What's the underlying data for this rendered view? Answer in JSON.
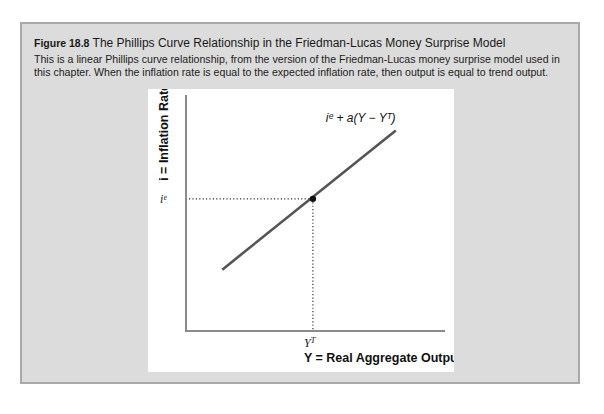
{
  "figure": {
    "number": "Figure 18.8",
    "title": "The Phillips Curve Relationship in the Friedman-Lucas Money Surprise Model",
    "description": "This is a linear Phillips curve relationship, from the version of the Friedman-Lucas money surprise model used in this chapter. When the inflation rate is equal to the expected inflation rate, then output is equal to trend output."
  },
  "chart_data": {
    "type": "line",
    "title": "The Phillips Curve Relationship in the Friedman-Lucas Money Surprise Model",
    "xlabel": "Y = Real Aggregate Output",
    "ylabel": "i = Inflation Rate",
    "x_tick_labels": [
      "Y^T"
    ],
    "y_tick_labels": [
      "i^e"
    ],
    "xlim": [
      0,
      10
    ],
    "ylim": [
      0,
      10
    ],
    "grid": false,
    "series": [
      {
        "name": "i^e + a(Y − Y^T)",
        "label": "iᵉ + a(Y − Yᵀ)",
        "x": [
          1.4,
          8.1
        ],
        "y": [
          2.6,
          8.5
        ],
        "color": "#555555"
      }
    ],
    "annotations": [
      {
        "type": "point",
        "x": 4.9,
        "y": 5.6,
        "label": "equilibrium (Y^T, i^e)"
      },
      {
        "type": "dotted-guide-horizontal",
        "y": 5.6,
        "label": "iᵉ"
      },
      {
        "type": "dotted-guide-vertical",
        "x": 4.9,
        "label": "Yᵀ"
      }
    ]
  },
  "labels": {
    "curve": "iᵉ + a(Y − Yᵀ)",
    "y_tick": "iᵉ",
    "x_tick": "YT",
    "x_axis": "Y = Real Aggregate Output",
    "y_axis": "i = Inflation Rate"
  },
  "colors": {
    "frame_bg": "#dcdcdc",
    "frame_border": "#a9a9a9",
    "curve": "#555555",
    "axis": "#888888"
  }
}
